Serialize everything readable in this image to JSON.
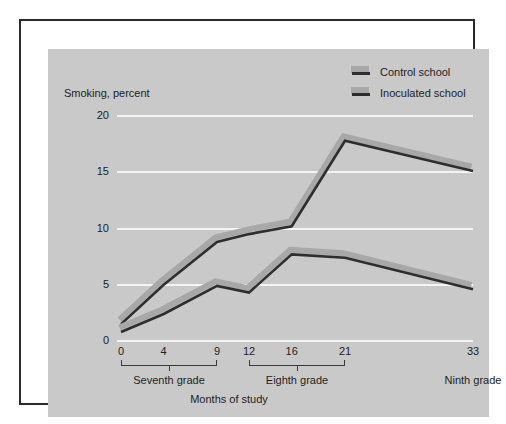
{
  "figure": {
    "axis_title": "Smoking, percent",
    "x_axis_label": "Months of study"
  },
  "legend": {
    "position": "top-right",
    "entries": [
      {
        "label": "Control school",
        "swatch": "ribbon-swatch-control"
      },
      {
        "label": "Inoculated school",
        "swatch": "ribbon-swatch-inoculated"
      }
    ]
  },
  "colors": {
    "canvas": "#c9c9c9",
    "frame": "#2b2b2b",
    "gridline": "#f4f4f4",
    "line_edge": "#2e2e2e",
    "line_shadow": "#a8a8a8",
    "text": "#1d1d1d"
  },
  "y_ticks": [
    "0",
    "5",
    "10",
    "15",
    "20"
  ],
  "x_ticks": [
    "0",
    "4",
    "9",
    "12",
    "16",
    "21",
    "33"
  ],
  "grade_groups": [
    {
      "label": "Seventh grade",
      "ticks": [
        "0",
        "4",
        "9"
      ],
      "bracket": true
    },
    {
      "label": "Eighth grade",
      "ticks": [
        "12",
        "16",
        "21"
      ],
      "bracket": true
    },
    {
      "label": "Ninth grade",
      "ticks": [
        "33"
      ],
      "bracket": false
    }
  ],
  "chart_data": {
    "type": "line",
    "title": "Smoking, percent",
    "xlabel": "Months of study",
    "ylabel": "Smoking, percent",
    "x": [
      0,
      4,
      9,
      12,
      16,
      21,
      33
    ],
    "xtick_labels": [
      "0",
      "4",
      "9",
      "12",
      "16",
      "21",
      "33"
    ],
    "ytick_labels": [
      "0",
      "5",
      "10",
      "15",
      "20"
    ],
    "xlim": [
      0,
      33
    ],
    "ylim": [
      0,
      20
    ],
    "grid": "horizontal",
    "legend_position": "top-right",
    "series": [
      {
        "name": "Control school",
        "values": [
          1.5,
          5.0,
          8.8,
          9.5,
          10.2,
          17.8,
          15.1
        ]
      },
      {
        "name": "Inoculated school",
        "values": [
          0.8,
          2.4,
          4.9,
          4.3,
          7.7,
          7.4,
          4.6
        ]
      }
    ]
  }
}
